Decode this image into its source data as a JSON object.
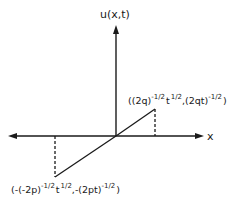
{
  "diagram": {
    "y_axis_label": "u(x,t)",
    "x_axis_label": "x",
    "upper_point": {
      "open": "((2q)",
      "exp1": "-1/2",
      "t": "t",
      "exp2": "1/2",
      "mid": ",(2qt)",
      "exp3": "-1/2",
      "close": ")"
    },
    "lower_point": {
      "open": "(-(-2p)",
      "exp1": "-1/2",
      "t": "t",
      "exp2": "1/2",
      "mid": ",-(2pt)",
      "exp3": "-1/2",
      "close": ")"
    },
    "colors": {
      "ink": "#1a1a1a",
      "background": "#ffffff"
    }
  }
}
